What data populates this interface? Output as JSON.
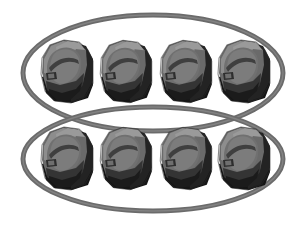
{
  "canvas": {
    "width": 306,
    "height": 225,
    "background_color": "#ffffff",
    "title": "Eight rock objects grouped into two rings of four"
  },
  "palette": {
    "ring_stroke": "#6b6b6b",
    "ring_stroke_light": "#8a8a8a",
    "ring_stroke_dark": "#545454",
    "rock_light": "#8d8d8d",
    "rock_mid": "#6a6a6a",
    "rock_shade": "#4a4a4a",
    "rock_dark": "#262626",
    "rock_darkest": "#151515",
    "rock_outline": "#2a2a2a",
    "background": "#ffffff"
  },
  "groups": [
    {
      "name": "top-group",
      "label": "group-1",
      "count": 4,
      "ellipse": {
        "cx": 153,
        "cy": 73,
        "rx": 130,
        "ry": 58,
        "stroke_width": 5
      }
    },
    {
      "name": "bottom-group",
      "label": "group-2",
      "count": 4,
      "ellipse": {
        "cx": 153,
        "cy": 159,
        "rx": 130,
        "ry": 52,
        "stroke_width": 5
      }
    }
  ],
  "objects": {
    "kind": "rock",
    "total": 8,
    "rows": 2,
    "per_row": 4,
    "positions": [
      {
        "name": "rock-r1-c1",
        "x": 66,
        "y": 71,
        "scale": 1.0,
        "row": 1,
        "col": 1
      },
      {
        "name": "rock-r1-c2",
        "x": 125,
        "y": 71,
        "scale": 0.99,
        "row": 1,
        "col": 2
      },
      {
        "name": "rock-r1-c3",
        "x": 185,
        "y": 71,
        "scale": 0.99,
        "row": 1,
        "col": 3
      },
      {
        "name": "rock-r1-c4",
        "x": 243,
        "y": 71,
        "scale": 1.0,
        "row": 1,
        "col": 4
      },
      {
        "name": "rock-r2-c1",
        "x": 66,
        "y": 158,
        "scale": 1.0,
        "row": 2,
        "col": 1
      },
      {
        "name": "rock-r2-c2",
        "x": 125,
        "y": 158,
        "scale": 0.99,
        "row": 2,
        "col": 2
      },
      {
        "name": "rock-r2-c3",
        "x": 185,
        "y": 158,
        "scale": 0.99,
        "row": 2,
        "col": 3
      },
      {
        "name": "rock-r2-c4",
        "x": 243,
        "y": 158,
        "scale": 1.0,
        "row": 2,
        "col": 4
      }
    ]
  }
}
